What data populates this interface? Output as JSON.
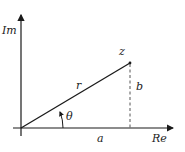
{
  "diagram": {
    "axes": {
      "imaginary_label": "Im",
      "real_label": "Re"
    },
    "point_label": "z",
    "modulus_label": "r",
    "angle_label": "θ",
    "real_part_label": "a",
    "imaginary_part_label": "b",
    "colors": {
      "line": "#1a1a1a",
      "dashed": "#555555",
      "background": "#ffffff"
    }
  }
}
